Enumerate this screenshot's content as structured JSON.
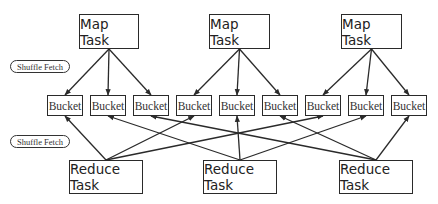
{
  "diagram": {
    "type": "mapreduce-shuffle",
    "labels": {
      "shuffle_fetch_top": "Shuffle Fetch",
      "shuffle_fetch_bottom": "Shuffle Fetch"
    },
    "map_tasks": [
      {
        "id": "map1",
        "label": "Map Task",
        "x": 79,
        "y": 14,
        "w": 60,
        "h": 35
      },
      {
        "id": "map2",
        "label": "Map Task",
        "x": 209,
        "y": 14,
        "w": 61,
        "h": 35
      },
      {
        "id": "map3",
        "label": "Map Task",
        "x": 341,
        "y": 14,
        "w": 61,
        "h": 35
      }
    ],
    "buckets": [
      {
        "id": "b1",
        "label": "Bucket",
        "x": 47,
        "y": 95,
        "w": 36,
        "h": 21
      },
      {
        "id": "b2",
        "label": "Bucket",
        "x": 90,
        "y": 95,
        "w": 36,
        "h": 21
      },
      {
        "id": "b3",
        "label": "Bucket",
        "x": 133,
        "y": 95,
        "w": 36,
        "h": 21
      },
      {
        "id": "b4",
        "label": "Bucket",
        "x": 176,
        "y": 95,
        "w": 36,
        "h": 21
      },
      {
        "id": "b5",
        "label": "Bucket",
        "x": 219,
        "y": 95,
        "w": 36,
        "h": 21
      },
      {
        "id": "b6",
        "label": "Bucket",
        "x": 262,
        "y": 95,
        "w": 36,
        "h": 21
      },
      {
        "id": "b7",
        "label": "Bucket",
        "x": 305,
        "y": 95,
        "w": 36,
        "h": 21
      },
      {
        "id": "b8",
        "label": "Bucket",
        "x": 348,
        "y": 95,
        "w": 36,
        "h": 21
      },
      {
        "id": "b9",
        "label": "Bucket",
        "x": 391,
        "y": 95,
        "w": 36,
        "h": 21
      }
    ],
    "reduce_tasks": [
      {
        "id": "red1",
        "label": "Reduce Task",
        "x": 69,
        "y": 160,
        "w": 74,
        "h": 34
      },
      {
        "id": "red2",
        "label": "Reduce Task",
        "x": 203,
        "y": 160,
        "w": 74,
        "h": 34
      },
      {
        "id": "red3",
        "label": "Reduce Task",
        "x": 339,
        "y": 160,
        "w": 74,
        "h": 34
      }
    ],
    "pills": [
      {
        "id": "pill1",
        "x": 10,
        "y": 60,
        "w": 60,
        "h": 13
      },
      {
        "id": "pill2",
        "x": 10,
        "y": 135,
        "w": 60,
        "h": 13
      }
    ],
    "map_edges": [
      [
        "map1",
        "b1"
      ],
      [
        "map1",
        "b2"
      ],
      [
        "map1",
        "b3"
      ],
      [
        "map2",
        "b4"
      ],
      [
        "map2",
        "b5"
      ],
      [
        "map2",
        "b6"
      ],
      [
        "map3",
        "b7"
      ],
      [
        "map3",
        "b8"
      ],
      [
        "map3",
        "b9"
      ]
    ],
    "fetch_edges": [
      [
        "red1",
        "b1"
      ],
      [
        "red1",
        "b4"
      ],
      [
        "red1",
        "b7"
      ],
      [
        "red2",
        "b2"
      ],
      [
        "red2",
        "b5"
      ],
      [
        "red2",
        "b8"
      ],
      [
        "red3",
        "b3"
      ],
      [
        "red3",
        "b6"
      ],
      [
        "red3",
        "b9"
      ]
    ],
    "colors": {
      "stroke": "#2a2a2a",
      "background": "#ffffff"
    }
  }
}
